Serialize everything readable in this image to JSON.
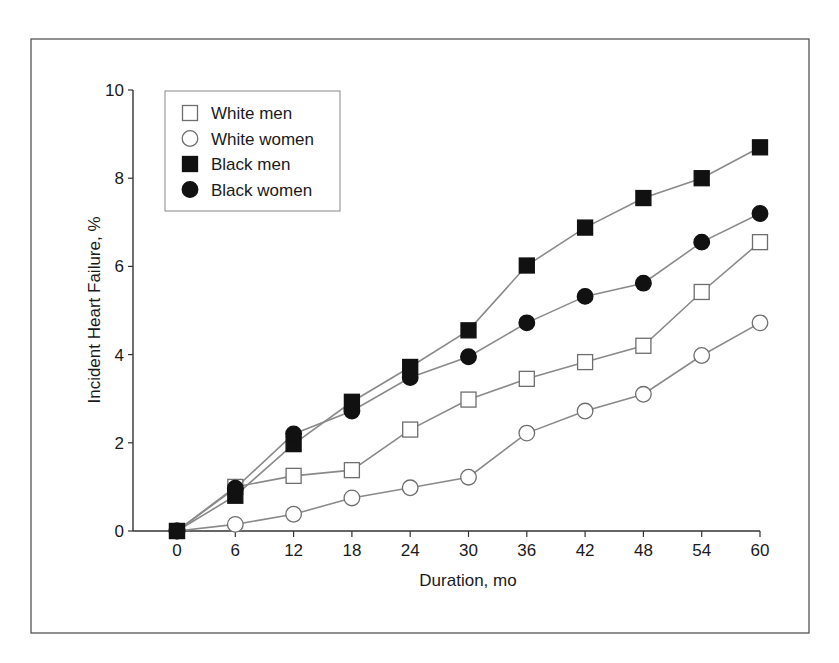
{
  "chart_data": {
    "type": "line",
    "title": "",
    "xlabel": "Duration, mo",
    "ylabel": "Incident Heart Failure, %",
    "x": [
      0,
      6,
      12,
      18,
      24,
      30,
      36,
      42,
      48,
      54,
      60
    ],
    "xticks": [
      "0",
      "6",
      "12",
      "18",
      "24",
      "30",
      "36",
      "42",
      "48",
      "54",
      "60"
    ],
    "yticks": [
      "0",
      "2",
      "4",
      "6",
      "8",
      "10"
    ],
    "xlim": [
      -6,
      60
    ],
    "ylim": [
      0,
      10
    ],
    "grid": false,
    "legend_position": "upper left",
    "series": [
      {
        "name": "White men",
        "marker": "open-square",
        "values": [
          0,
          1.0,
          1.25,
          1.38,
          2.3,
          2.98,
          3.45,
          3.83,
          4.2,
          5.42,
          6.55
        ]
      },
      {
        "name": "White women",
        "marker": "open-circle",
        "values": [
          0,
          0.15,
          0.38,
          0.75,
          0.98,
          1.22,
          2.22,
          2.72,
          3.1,
          3.98,
          4.72
        ]
      },
      {
        "name": "Black men",
        "marker": "filled-square",
        "values": [
          0,
          0.8,
          1.97,
          2.93,
          3.72,
          4.55,
          6.02,
          6.88,
          7.55,
          8.0,
          8.7
        ]
      },
      {
        "name": "Black women",
        "marker": "filled-circle",
        "values": [
          0,
          0.97,
          2.2,
          2.72,
          3.48,
          3.95,
          4.72,
          5.32,
          5.62,
          6.55,
          7.2
        ]
      }
    ]
  },
  "colors": {
    "line": "#8a8a8a",
    "marker_fill_dark": "#111111",
    "marker_fill_open": "#ffffff",
    "marker_stroke_open": "#6e6e6e",
    "axis": "#333333",
    "frame": "#555555"
  }
}
